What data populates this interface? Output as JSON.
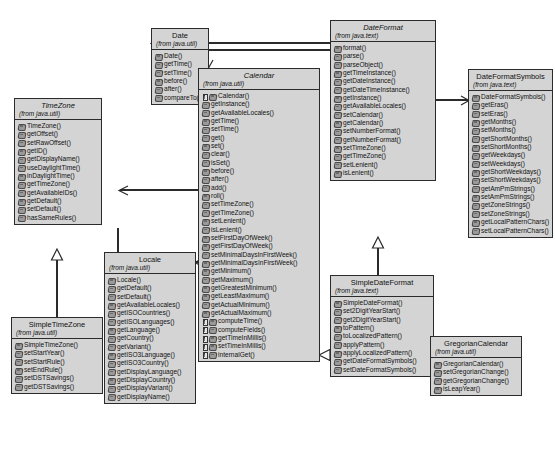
{
  "diagram": {
    "type": "uml-class-diagram",
    "background_color": "#ffffff",
    "box_fill_color": "#d4d4d4",
    "border_color": "#2b2b2b"
  },
  "classes": [
    {
      "id": "timezone",
      "name": "TimeZone",
      "package": "(from java.util)",
      "abstract": true,
      "operations": [
        {
          "name": "TimeZone()",
          "abstract": false
        },
        {
          "name": "getOffset()",
          "abstract": false
        },
        {
          "name": "setRawOffset()",
          "abstract": false
        },
        {
          "name": "getID()",
          "abstract": false
        },
        {
          "name": "getDisplayName()",
          "abstract": false
        },
        {
          "name": "useDaylightTime()",
          "abstract": false
        },
        {
          "name": "inDaylightTime()",
          "abstract": false
        },
        {
          "name": "getTimeZone()",
          "abstract": false
        },
        {
          "name": "getAvailableIDs()",
          "abstract": false
        },
        {
          "name": "getDefault()",
          "abstract": false
        },
        {
          "name": "setDefault()",
          "abstract": false
        },
        {
          "name": "hasSameRules()",
          "abstract": false
        }
      ]
    },
    {
      "id": "simpletimezone",
      "name": "SimpleTimeZone",
      "package": "(from java.util)",
      "abstract": false,
      "operations": [
        {
          "name": "SimpleTimeZone()",
          "abstract": false
        },
        {
          "name": "setStartYear()",
          "abstract": false
        },
        {
          "name": "setStartRule()",
          "abstract": false
        },
        {
          "name": "setEndRule()",
          "abstract": false
        },
        {
          "name": "setDSTSavings()",
          "abstract": false
        },
        {
          "name": "getDSTSavings()",
          "abstract": false
        }
      ]
    },
    {
      "id": "date",
      "name": "Date",
      "package": "(from java.util)",
      "abstract": false,
      "operations": [
        {
          "name": "Date()",
          "abstract": false
        },
        {
          "name": "getTime()",
          "abstract": false
        },
        {
          "name": "setTime()",
          "abstract": false
        },
        {
          "name": "before()",
          "abstract": false
        },
        {
          "name": "after()",
          "abstract": false
        },
        {
          "name": "compareTo()",
          "abstract": false
        }
      ]
    },
    {
      "id": "locale",
      "name": "Locale",
      "package": "(from java.util)",
      "abstract": false,
      "operations": [
        {
          "name": "Locale()",
          "abstract": false
        },
        {
          "name": "getDefault()",
          "abstract": false
        },
        {
          "name": "setDefault()",
          "abstract": false
        },
        {
          "name": "getAvailableLocales()",
          "abstract": false
        },
        {
          "name": "getISOCountries()",
          "abstract": false
        },
        {
          "name": "getISOLanguages()",
          "abstract": false
        },
        {
          "name": "getLanguage()",
          "abstract": false
        },
        {
          "name": "getCountry()",
          "abstract": false
        },
        {
          "name": "getVariant()",
          "abstract": false
        },
        {
          "name": "getISO3Language()",
          "abstract": false
        },
        {
          "name": "getISO3Country()",
          "abstract": false
        },
        {
          "name": "getDisplayLanguage()",
          "abstract": false
        },
        {
          "name": "getDisplayCountry()",
          "abstract": false
        },
        {
          "name": "getDisplayVariant()",
          "abstract": false
        },
        {
          "name": "getDisplayName()",
          "abstract": false
        }
      ]
    },
    {
      "id": "calendar",
      "name": "Calendar",
      "package": "(from java.util)",
      "abstract": true,
      "operations": [
        {
          "name": "Calendar()",
          "abstract": true
        },
        {
          "name": "getInstance()",
          "abstract": false
        },
        {
          "name": "getAvailableLocales()",
          "abstract": false
        },
        {
          "name": "getTime()",
          "abstract": false
        },
        {
          "name": "setTime()",
          "abstract": false
        },
        {
          "name": "get()",
          "abstract": false
        },
        {
          "name": "set()",
          "abstract": false
        },
        {
          "name": "clear()",
          "abstract": false
        },
        {
          "name": "isSet()",
          "abstract": false
        },
        {
          "name": "before()",
          "abstract": false
        },
        {
          "name": "after()",
          "abstract": false
        },
        {
          "name": "add()",
          "abstract": false
        },
        {
          "name": "roll()",
          "abstract": false
        },
        {
          "name": "setTimeZone()",
          "abstract": false
        },
        {
          "name": "getTimeZone()",
          "abstract": false
        },
        {
          "name": "setLenient()",
          "abstract": false
        },
        {
          "name": "isLenient()",
          "abstract": false
        },
        {
          "name": "setFirstDayOfWeek()",
          "abstract": false
        },
        {
          "name": "getFirstDayOfWeek()",
          "abstract": false
        },
        {
          "name": "setMinimalDaysInFirstWeek()",
          "abstract": false
        },
        {
          "name": "getMinimalDaysInFirstWeek()",
          "abstract": false
        },
        {
          "name": "getMinimum()",
          "abstract": false
        },
        {
          "name": "getMaximum()",
          "abstract": false
        },
        {
          "name": "getGreatestMinimum()",
          "abstract": false
        },
        {
          "name": "getLeastMaximum()",
          "abstract": false
        },
        {
          "name": "getActualMinimum()",
          "abstract": false
        },
        {
          "name": "getActualMaximum()",
          "abstract": false
        },
        {
          "name": "computeTime()",
          "abstract": true
        },
        {
          "name": "computeFields()",
          "abstract": true
        },
        {
          "name": "getTimeInMillis()",
          "abstract": true
        },
        {
          "name": "setTimeInMillis()",
          "abstract": true
        },
        {
          "name": "internalGet()",
          "abstract": true
        }
      ]
    },
    {
      "id": "dateformat",
      "name": "DateFormat",
      "package": "(from java.text)",
      "abstract": true,
      "operations": [
        {
          "name": "format()",
          "abstract": false
        },
        {
          "name": "parse()",
          "abstract": false
        },
        {
          "name": "parseObject()",
          "abstract": false
        },
        {
          "name": "getTimeInstance()",
          "abstract": false
        },
        {
          "name": "getDateInstance()",
          "abstract": false
        },
        {
          "name": "getDateTimeInstance()",
          "abstract": false
        },
        {
          "name": "getInstance()",
          "abstract": false
        },
        {
          "name": "getAvailableLocales()",
          "abstract": false
        },
        {
          "name": "setCalendar()",
          "abstract": false
        },
        {
          "name": "getCalendar()",
          "abstract": false
        },
        {
          "name": "setNumberFormat()",
          "abstract": false
        },
        {
          "name": "getNumberFormat()",
          "abstract": false
        },
        {
          "name": "setTimeZone()",
          "abstract": false
        },
        {
          "name": "getTimeZone()",
          "abstract": false
        },
        {
          "name": "setLenient()",
          "abstract": false
        },
        {
          "name": "isLenient()",
          "abstract": false
        }
      ]
    },
    {
      "id": "dateformatsymbols",
      "name": "DateFormatSymbols",
      "package": "(from java.text)",
      "abstract": false,
      "operations": [
        {
          "name": "DateFormatSymbols()",
          "abstract": false
        },
        {
          "name": "getEras()",
          "abstract": false
        },
        {
          "name": "setEras()",
          "abstract": false
        },
        {
          "name": "getMonths()",
          "abstract": false
        },
        {
          "name": "setMonths()",
          "abstract": false
        },
        {
          "name": "getShortMonths()",
          "abstract": false
        },
        {
          "name": "setShortMonths()",
          "abstract": false
        },
        {
          "name": "getWeekdays()",
          "abstract": false
        },
        {
          "name": "setWeekdays()",
          "abstract": false
        },
        {
          "name": "getShortWeekdays()",
          "abstract": false
        },
        {
          "name": "setShortWeekdays()",
          "abstract": false
        },
        {
          "name": "getAmPmStrings()",
          "abstract": false
        },
        {
          "name": "setAmPmStrings()",
          "abstract": false
        },
        {
          "name": "getZoneStrings()",
          "abstract": false
        },
        {
          "name": "setZoneStrings()",
          "abstract": false
        },
        {
          "name": "getLocalPatternChars()",
          "abstract": false
        },
        {
          "name": "setLocalPatternChars()",
          "abstract": false
        }
      ]
    },
    {
      "id": "simpledateformat",
      "name": "SimpleDateFormat",
      "package": "(from java.text)",
      "abstract": false,
      "operations": [
        {
          "name": "SimpleDateFormat()",
          "abstract": false
        },
        {
          "name": "set2DigitYearStart()",
          "abstract": false
        },
        {
          "name": "get2DigitYearStart()",
          "abstract": false
        },
        {
          "name": "toPattern()",
          "abstract": false
        },
        {
          "name": "toLocalizedPattern()",
          "abstract": false
        },
        {
          "name": "applyPattern()",
          "abstract": false
        },
        {
          "name": "applyLocalizedPattern()",
          "abstract": false
        },
        {
          "name": "getDateFormatSymbols()",
          "abstract": false
        },
        {
          "name": "setDateFormatSymbols()",
          "abstract": false
        }
      ]
    },
    {
      "id": "gregoriancalendar",
      "name": "GregorianCalendar",
      "package": "(from java.util)",
      "abstract": false,
      "operations": [
        {
          "name": "GregorianCalendar()",
          "abstract": false
        },
        {
          "name": "setGregorianChange()",
          "abstract": false
        },
        {
          "name": "getGregorianChange()",
          "abstract": false
        },
        {
          "name": "isLeapYear()",
          "abstract": false
        }
      ]
    }
  ],
  "relationships": [
    {
      "from": "simpletimezone",
      "to": "timezone",
      "type": "generalization"
    },
    {
      "from": "simpledateformat",
      "to": "dateformat",
      "type": "generalization"
    },
    {
      "from": "gregoriancalendar",
      "to": "calendar",
      "type": "generalization"
    },
    {
      "from": "dateformat",
      "to": "date",
      "type": "association"
    },
    {
      "from": "dateformat",
      "to": "calendar",
      "type": "association"
    },
    {
      "from": "dateformat",
      "to": "dateformatsymbols",
      "type": "association"
    },
    {
      "from": "calendar",
      "to": "date",
      "type": "association"
    },
    {
      "from": "calendar",
      "to": "timezone",
      "type": "association"
    },
    {
      "from": "calendar",
      "to": "locale",
      "type": "association"
    },
    {
      "from": "timezone",
      "to": "locale",
      "type": "association"
    }
  ]
}
